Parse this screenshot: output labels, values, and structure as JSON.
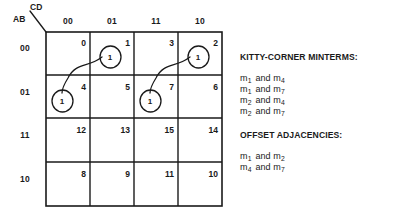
{
  "diagram": {
    "type": "karnaugh-map",
    "axis": {
      "columns_variable": "CD",
      "rows_variable": "AB"
    },
    "column_headers": [
      "00",
      "01",
      "11",
      "10"
    ],
    "row_headers": [
      "00",
      "01",
      "11",
      "10"
    ],
    "cells": [
      [
        {
          "index": "0",
          "value": ""
        },
        {
          "index": "1",
          "value": "1"
        },
        {
          "index": "3",
          "value": ""
        },
        {
          "index": "2",
          "value": "1"
        }
      ],
      [
        {
          "index": "4",
          "value": "1"
        },
        {
          "index": "5",
          "value": ""
        },
        {
          "index": "7",
          "value": "1"
        },
        {
          "index": "6",
          "value": ""
        }
      ],
      [
        {
          "index": "12",
          "value": ""
        },
        {
          "index": "13",
          "value": ""
        },
        {
          "index": "15",
          "value": ""
        },
        {
          "index": "14",
          "value": ""
        }
      ],
      [
        {
          "index": "8",
          "value": ""
        },
        {
          "index": "9",
          "value": ""
        },
        {
          "index": "11",
          "value": ""
        },
        {
          "index": "10",
          "value": ""
        }
      ]
    ],
    "connectors": [
      {
        "from": "1",
        "to": "4"
      },
      {
        "from": "2",
        "to": "7"
      }
    ],
    "ink_color": "#1a1a1a"
  },
  "legend": {
    "kitty_corner_heading": "KITTY-CORNER MINTERMS:",
    "kitty_corner_pairs": [
      {
        "left_sub": "1",
        "right_sub": "4"
      },
      {
        "left_sub": "1",
        "right_sub": "7"
      },
      {
        "left_sub": "2",
        "right_sub": "4"
      },
      {
        "left_sub": "2",
        "right_sub": "7"
      }
    ],
    "offset_heading": "OFFSET ADJACENCIES:",
    "offset_pairs": [
      {
        "left_sub": "1",
        "right_sub": "2"
      },
      {
        "left_sub": "4",
        "right_sub": "7"
      }
    ],
    "term_symbol": "m",
    "conjunction": "and"
  }
}
